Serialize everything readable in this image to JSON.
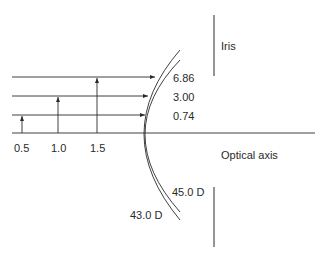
{
  "diagram": {
    "labels": {
      "iris": "Iris",
      "optical_axis": "Optical axis",
      "power_inner": "45.0 D",
      "power_outer": "43.0 D"
    },
    "ray_heights": [
      "0.5",
      "1.0",
      "1.5"
    ],
    "ray_values": [
      "6.86",
      "3.00",
      "0.74"
    ],
    "colors": {
      "stroke": "#2a2a2a",
      "background": "#ffffff"
    }
  }
}
